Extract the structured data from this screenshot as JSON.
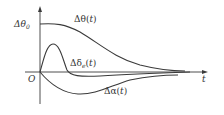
{
  "diagram": {
    "axes": {
      "x_label": "t",
      "origin_label": "O",
      "y_tick_label": "Δθ",
      "y_tick_sub": "0"
    },
    "curves": [
      {
        "name": "delta-theta",
        "label_main": "Δθ(",
        "label_var": "t",
        "label_end": ")"
      },
      {
        "name": "delta-delta-e",
        "label_main": "Δδ",
        "label_sub": "e",
        "label_open": "(",
        "label_var": "t",
        "label_end": ")"
      },
      {
        "name": "delta-alpha",
        "label_main": "Δα(",
        "label_var": "t",
        "label_end": ")"
      }
    ],
    "colors": {
      "line": "#3a3a3a",
      "background": "#ffffff"
    }
  }
}
